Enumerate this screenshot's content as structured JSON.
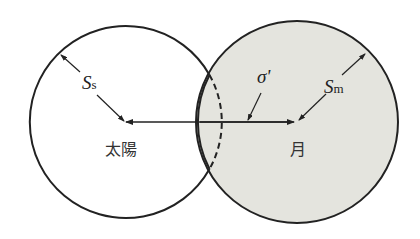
{
  "diagram": {
    "sun": {
      "label": "太陽",
      "radius_symbol": "S",
      "radius_subscript": "s",
      "fill": "#ffffff"
    },
    "moon": {
      "label": "月",
      "radius_symbol": "S",
      "radius_subscript": "m",
      "fill": "#e4e4de"
    },
    "separation": {
      "symbol": "σ'"
    },
    "stroke": "#222222"
  }
}
